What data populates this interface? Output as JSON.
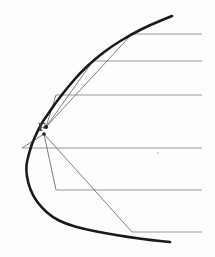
{
  "figure": {
    "width": 215,
    "height": 257,
    "background_color": "#fdfdfd"
  },
  "labels": {
    "focus": "F",
    "focus_label_x": 38,
    "focus_label_y": 120
  },
  "colors": {
    "parabola": "#1a1a1a",
    "incoming_ray": "#8c8c8c",
    "reflected_ray": "#6e6e6e",
    "focus_dot": "#222222",
    "speck": "#cfcfcf"
  },
  "chart_data": {
    "type": "line",
    "xlabel": "",
    "ylabel": "",
    "grid": false,
    "legend": "none",
    "xlim": [
      0,
      215
    ],
    "ylim": [
      0,
      257
    ],
    "parabola": {
      "name": "parabola",
      "orientation": "opens-right",
      "vertex": [
        19,
        128
      ],
      "focal_length_px": 26,
      "stroke_width": 2.6,
      "color": "#1a1a1a",
      "points": [
        [
          172,
          16
        ],
        [
          150,
          25
        ],
        [
          132,
          34
        ],
        [
          112,
          46
        ],
        [
          95,
          59
        ],
        [
          80,
          73
        ],
        [
          68,
          87
        ],
        [
          57,
          101
        ],
        [
          48,
          114
        ],
        [
          41,
          124
        ],
        [
          33,
          141
        ],
        [
          30,
          150
        ],
        [
          27,
          161
        ],
        [
          26,
          170
        ],
        [
          28,
          183
        ],
        [
          33,
          196
        ],
        [
          41,
          207
        ],
        [
          52,
          217
        ],
        [
          66,
          224
        ],
        [
          84,
          229
        ],
        [
          104,
          233
        ],
        [
          128,
          237
        ],
        [
          150,
          240
        ],
        [
          170,
          242
        ]
      ]
    },
    "focus_point": {
      "name": "focus",
      "label": "F",
      "x": 46,
      "y": 127,
      "marker": "dot",
      "marker_radius": 2.0
    },
    "focus_secondary_point": {
      "name": "focus-lower-dot",
      "x": 44,
      "y": 134,
      "marker": "dot",
      "marker_radius": 1.8
    },
    "rays": [
      {
        "id": "ray-1",
        "incoming_y": 34,
        "incoming_from_x": 202,
        "hit_point": [
          132,
          34
        ],
        "reflect_to": [
          46,
          127
        ]
      },
      {
        "id": "ray-2",
        "incoming_y": 61,
        "incoming_from_x": 202,
        "hit_point": [
          93,
          61
        ],
        "reflect_to": [
          46,
          127
        ]
      },
      {
        "id": "ray-3",
        "incoming_y": 95,
        "incoming_from_x": 202,
        "hit_point": [
          56,
          95
        ],
        "reflect_to": [
          46,
          127
        ]
      },
      {
        "id": "ray-4",
        "incoming_y": 148,
        "incoming_from_x": 202,
        "hit_point": [
          22,
          148
        ],
        "reflect_to": [
          44,
          134
        ]
      },
      {
        "id": "ray-5",
        "incoming_y": 190,
        "incoming_from_x": 202,
        "hit_point": [
          56,
          190
        ],
        "reflect_to": [
          44,
          134
        ]
      },
      {
        "id": "ray-6",
        "incoming_y": 232,
        "incoming_from_x": 202,
        "hit_point": [
          132,
          232
        ],
        "reflect_to": [
          44,
          134
        ]
      }
    ],
    "artifacts": [
      {
        "id": "speck-1",
        "x": 158,
        "y": 153,
        "radius": 1.2,
        "color": "#d5d5d5"
      }
    ]
  }
}
